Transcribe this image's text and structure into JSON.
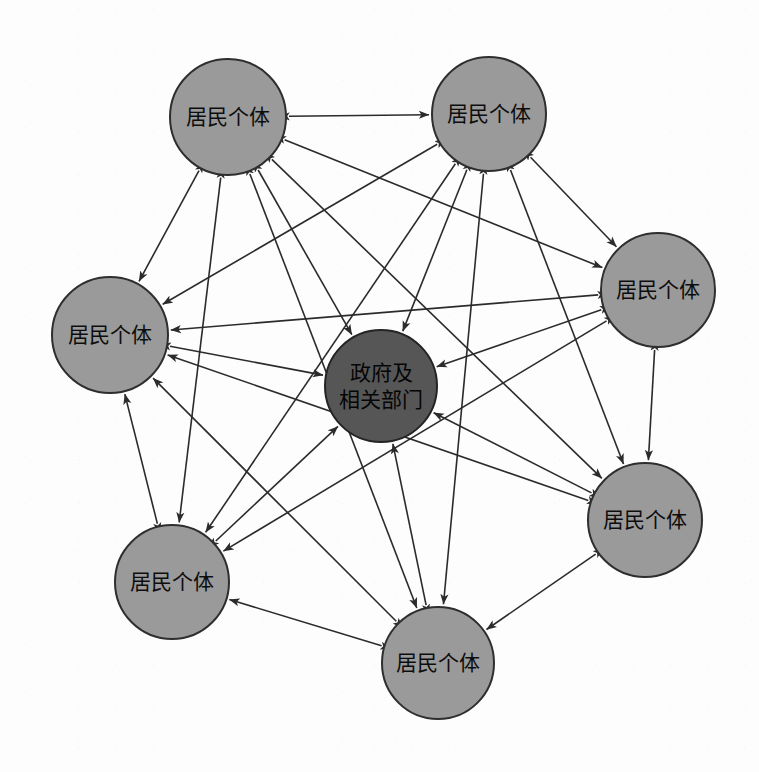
{
  "diagram": {
    "background_color": "#fdfdfd",
    "node_fill_outer": "#9a9a9a",
    "node_fill_center": "#565656",
    "node_stroke": "#2e2e2e",
    "edge_color": "#2b2b2b",
    "label_resident": "居民个体",
    "label_government_line1": "政府及",
    "label_government_line2": "相关部门",
    "nodes": [
      {
        "id": "r1",
        "label": "居民个体",
        "role": "resident",
        "cx": 228,
        "cy": 117,
        "r": 58
      },
      {
        "id": "r2",
        "label": "居民个体",
        "role": "resident",
        "cx": 489,
        "cy": 114,
        "r": 57
      },
      {
        "id": "r3",
        "label": "居民个体",
        "role": "resident",
        "cx": 658,
        "cy": 290,
        "r": 57
      },
      {
        "id": "r4",
        "label": "居民个体",
        "role": "resident",
        "cx": 645,
        "cy": 520,
        "r": 57
      },
      {
        "id": "r5",
        "label": "居民个体",
        "role": "resident",
        "cx": 438,
        "cy": 663,
        "r": 56
      },
      {
        "id": "r6",
        "label": "居民个体",
        "role": "resident",
        "cx": 172,
        "cy": 582,
        "r": 57
      },
      {
        "id": "r7",
        "label": "居民个体",
        "role": "resident",
        "cx": 110,
        "cy": 335,
        "r": 58
      },
      {
        "id": "g1",
        "label": "政府及相关部门",
        "role": "government",
        "cx": 381,
        "cy": 386,
        "r": 56
      }
    ],
    "edges": [
      {
        "from": "r1",
        "to": "r2",
        "arrow": "both"
      },
      {
        "from": "r1",
        "to": "r3",
        "arrow": "both"
      },
      {
        "from": "r1",
        "to": "r4",
        "arrow": "both"
      },
      {
        "from": "r1",
        "to": "r5",
        "arrow": "both"
      },
      {
        "from": "r1",
        "to": "r6",
        "arrow": "both"
      },
      {
        "from": "r1",
        "to": "r7",
        "arrow": "both"
      },
      {
        "from": "r1",
        "to": "g1",
        "arrow": "both"
      },
      {
        "from": "r2",
        "to": "r3",
        "arrow": "both"
      },
      {
        "from": "r2",
        "to": "r4",
        "arrow": "both"
      },
      {
        "from": "r2",
        "to": "r5",
        "arrow": "both"
      },
      {
        "from": "r2",
        "to": "r6",
        "arrow": "both"
      },
      {
        "from": "r2",
        "to": "r7",
        "arrow": "both"
      },
      {
        "from": "r2",
        "to": "g1",
        "arrow": "both"
      },
      {
        "from": "r3",
        "to": "r4",
        "arrow": "both"
      },
      {
        "from": "r3",
        "to": "r6",
        "arrow": "both"
      },
      {
        "from": "r3",
        "to": "r7",
        "arrow": "both"
      },
      {
        "from": "r3",
        "to": "g1",
        "arrow": "both"
      },
      {
        "from": "r4",
        "to": "r5",
        "arrow": "both"
      },
      {
        "from": "r4",
        "to": "r7",
        "arrow": "both"
      },
      {
        "from": "r4",
        "to": "g1",
        "arrow": "both"
      },
      {
        "from": "r5",
        "to": "r6",
        "arrow": "both"
      },
      {
        "from": "r5",
        "to": "r7",
        "arrow": "both"
      },
      {
        "from": "r5",
        "to": "g1",
        "arrow": "both"
      },
      {
        "from": "r6",
        "to": "r7",
        "arrow": "both"
      },
      {
        "from": "r6",
        "to": "g1",
        "arrow": "both"
      },
      {
        "from": "r7",
        "to": "g1",
        "arrow": "both"
      }
    ]
  }
}
